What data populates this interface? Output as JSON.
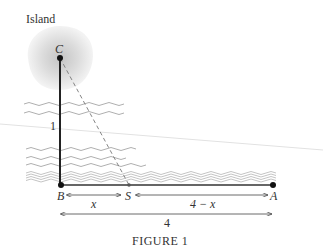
{
  "diagram": {
    "island_label": "Island",
    "points": {
      "C": "C",
      "B": "B",
      "S": "S",
      "A": "A"
    },
    "segment_labels": {
      "vertical": "1",
      "bs": "x",
      "sa": "4 − x",
      "total": "4"
    },
    "caption": "FIGURE 1"
  },
  "colors": {
    "line": "#222222",
    "dashed": "#777777",
    "wave": "#9a9a9a",
    "island": "#d8d8d8"
  }
}
